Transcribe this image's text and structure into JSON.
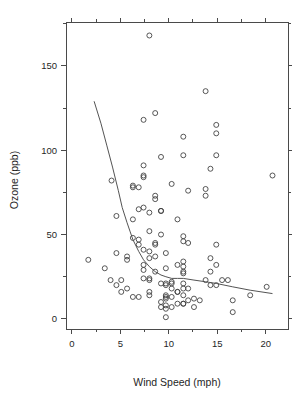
{
  "figure": {
    "title": "",
    "background_color": "#ffffff",
    "foreground_color": "#3a3a3a"
  },
  "axes": {
    "x_title": "Wind Speed (mph)",
    "y_title": "Ozone (ppb)",
    "x_major_ticks": [
      0,
      5,
      10,
      15,
      20
    ],
    "y_major_ticks": [
      0,
      50,
      100,
      150
    ],
    "x_minor_ticks": [
      2.5,
      7.5,
      12.5,
      17.5
    ],
    "y_minor_ticks": [
      25,
      75,
      125,
      175
    ],
    "x_tick_labels": [
      "0",
      "5",
      "10",
      "15",
      "20"
    ],
    "y_tick_labels": [
      "0",
      "50",
      "100",
      "150"
    ],
    "xlim": [
      -0.6,
      22.3
    ],
    "ylim": [
      -6,
      176
    ],
    "frame": "box"
  },
  "chart_data": {
    "type": "scatter",
    "title": "",
    "xlabel": "Wind Speed (mph)",
    "ylabel": "Ozone (ppb)",
    "xlim": [
      -0.6,
      22.3
    ],
    "ylim": [
      -6,
      176
    ],
    "grid": false,
    "legend": null,
    "marker": "open-circle",
    "x": [
      7.4,
      8.0,
      12.6,
      11.5,
      8.6,
      13.8,
      20.1,
      9.7,
      9.2,
      10.9,
      13.2,
      11.5,
      12.0,
      18.4,
      11.5,
      9.7,
      9.7,
      16.6,
      9.7,
      12.0,
      16.6,
      14.9,
      8.0,
      12.0,
      14.9,
      5.7,
      7.4,
      8.6,
      9.7,
      16.1,
      9.2,
      8.6,
      14.3,
      9.7,
      6.9,
      13.8,
      11.5,
      10.9,
      9.2,
      8.0,
      13.8,
      11.5,
      14.9,
      20.7,
      9.2,
      11.5,
      10.3,
      6.3,
      1.7,
      4.6,
      6.3,
      8.0,
      8.0,
      10.3,
      11.5,
      14.9,
      8.0,
      4.1,
      9.2,
      9.2,
      10.9,
      4.6,
      10.9,
      5.1,
      6.3,
      5.7,
      7.4,
      8.6,
      14.3,
      14.9,
      14.9,
      14.3,
      6.9,
      10.3,
      6.3,
      5.1,
      11.5,
      6.9,
      9.7,
      11.5,
      8.6,
      8.0,
      8.6,
      12.0,
      7.4,
      7.4,
      7.4,
      9.2,
      6.9,
      13.8,
      7.4,
      6.9,
      7.4,
      4.6,
      4.0,
      10.3,
      8.0,
      8.6,
      11.5,
      11.5,
      11.5,
      9.7,
      11.5,
      10.3,
      6.3,
      7.4,
      10.9,
      10.3,
      15.5,
      14.3,
      12.6,
      9.7,
      3.4,
      8.0,
      5.7,
      9.7,
      2.3,
      6.3,
      6.3,
      6.9,
      5.1,
      2.8,
      4.6,
      7.4,
      15.5,
      10.9,
      10.3,
      10.9,
      9.7,
      14.9,
      15.5,
      6.3,
      10.9,
      11.5,
      6.9,
      13.8,
      10.3,
      10.3,
      8.0,
      12.6,
      9.2,
      10.3,
      10.3,
      16.6,
      6.9,
      13.2,
      14.3,
      8.0,
      11.5
    ],
    "y": [
      41,
      36,
      12,
      18,
      28,
      23,
      19,
      8,
      7,
      16,
      11,
      14,
      18,
      14,
      34,
      6,
      30,
      11,
      1,
      11,
      4,
      32,
      23,
      45,
      115,
      37,
      29,
      71,
      39,
      23,
      21,
      37,
      20,
      12,
      13,
      135,
      49,
      32,
      64,
      40,
      77,
      97,
      97,
      85,
      10,
      27,
      7,
      48,
      35,
      61,
      79,
      63,
      16,
      80,
      108,
      20,
      52,
      82,
      50,
      64,
      59,
      39,
      9,
      16,
      78,
      35,
      66,
      122,
      89,
      110,
      44,
      28,
      65,
      22,
      59,
      23,
      31,
      44,
      21,
      9,
      45,
      168,
      73,
      76,
      118,
      84,
      85,
      96,
      78,
      73,
      91,
      47,
      32,
      20,
      23,
      21,
      24,
      44,
      21,
      28,
      9,
      13,
      46,
      18,
      13,
      24,
      16,
      13,
      23,
      36,
      7,
      14,
      30,
      14,
      18,
      20
    ],
    "n_points": 116,
    "smooth_line": {
      "label": "lowess",
      "x": [
        2.3,
        3.0,
        3.6,
        4.2,
        4.8,
        5.2,
        5.7,
        6.0,
        6.3,
        6.9,
        7.4,
        8.0,
        8.6,
        9.2,
        9.7,
        10.3,
        10.9,
        11.5,
        12.6,
        13.8,
        14.9,
        16.6,
        18.4,
        20.7
      ],
      "y": [
        129,
        116,
        103,
        90,
        76,
        66,
        57,
        52,
        47,
        40,
        35,
        31,
        28,
        26,
        25,
        24,
        24,
        24,
        23,
        22,
        21,
        19,
        17,
        15
      ]
    }
  }
}
